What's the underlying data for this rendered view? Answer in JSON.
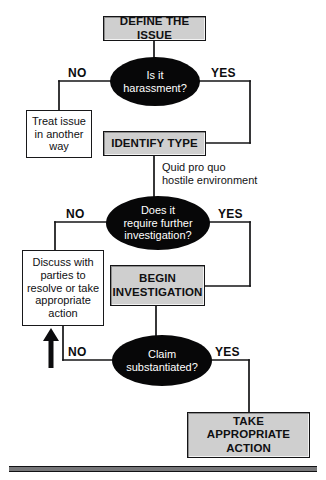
{
  "diagram": {
    "colors": {
      "shaded_box_fill": "#cfcfcf",
      "plain_box_fill": "#ffffff",
      "ellipse_fill": "#070708",
      "ellipse_text": "#ffffff",
      "line": "#141416",
      "text": "#101012"
    },
    "nodes": [
      {
        "id": "define-the-issue",
        "type": "process-shaded",
        "label": "DEFINE THE ISSUE"
      },
      {
        "id": "is-it-harassment",
        "type": "decision",
        "label": "Is it\nharassment?"
      },
      {
        "id": "treat-issue-another-way",
        "type": "process",
        "label": "Treat issue\nin another\nway"
      },
      {
        "id": "identify-type",
        "type": "process-shaded",
        "label": "IDENTIFY TYPE"
      },
      {
        "id": "does-it-require-further-investigation",
        "type": "decision",
        "label": "Does it\nrequire further\ninvestigation?"
      },
      {
        "id": "discuss-with-parties",
        "type": "process",
        "label": "Discuss with\nparties to\nresolve or take\nappropriate\naction"
      },
      {
        "id": "begin-investigation",
        "type": "process-shaded",
        "label": "BEGIN\nINVESTIGATION"
      },
      {
        "id": "claim-substantiated",
        "type": "decision",
        "label": "Claim\nsubstantiated?"
      },
      {
        "id": "take-appropriate-action",
        "type": "process-shaded",
        "label": "TAKE APPROPRIATE\nACTION"
      }
    ],
    "edge_labels": {
      "harassment_no": "NO",
      "harassment_yes": "YES",
      "investigation_no": "NO",
      "investigation_yes": "YES",
      "substantiated_no": "NO",
      "substantiated_yes": "YES"
    },
    "annotations": {
      "harassment_types": "Quid pro quo\nhostile environment"
    }
  }
}
